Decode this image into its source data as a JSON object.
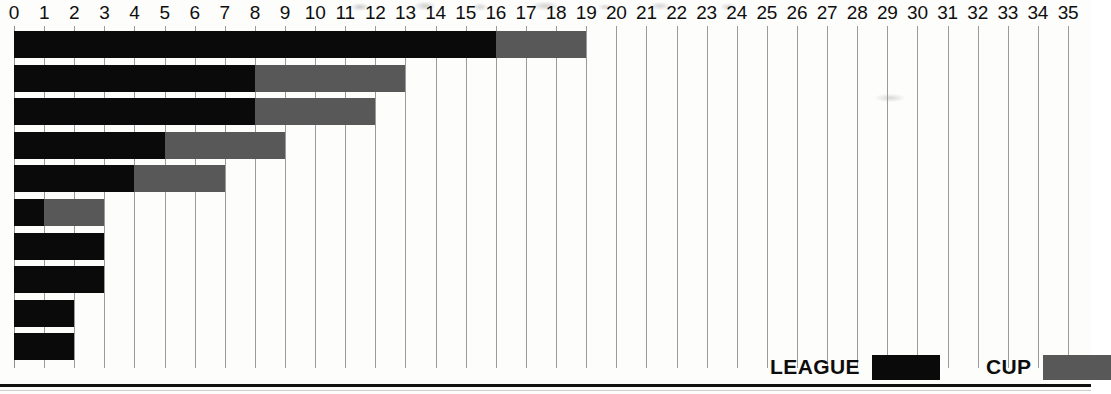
{
  "chart_data": {
    "type": "bar",
    "orientation": "horizontal",
    "stacked": true,
    "title": "",
    "subtitle": "",
    "xlabel": "",
    "ylabel": "",
    "xlim": [
      0,
      35
    ],
    "x_ticks": [
      0,
      1,
      2,
      3,
      4,
      5,
      6,
      7,
      8,
      9,
      10,
      11,
      12,
      13,
      14,
      15,
      16,
      17,
      18,
      19,
      20,
      21,
      22,
      23,
      24,
      25,
      26,
      27,
      28,
      29,
      30,
      31,
      32,
      33,
      34,
      35
    ],
    "x_tick_labels": [
      "0",
      "1",
      "2",
      "3",
      "4",
      "5",
      "6",
      "7",
      "8",
      "9",
      "10",
      "11",
      "12",
      "13",
      "14",
      "15",
      "16",
      "17",
      "18",
      "19",
      "20",
      "21",
      "22",
      "23",
      "24",
      "25",
      "26",
      "27",
      "28",
      "29",
      "30",
      "31",
      "32",
      "33",
      "34",
      "35"
    ],
    "grid": true,
    "grid_axis": "x",
    "categories": [
      "",
      "",
      "",
      "",
      "",
      "",
      "",
      "",
      "",
      ""
    ],
    "series": [
      {
        "name": "LEAGUE",
        "color": "#0a0a0a",
        "values": [
          16,
          8,
          8,
          5,
          4,
          1,
          3,
          3,
          2,
          2
        ]
      },
      {
        "name": "CUP",
        "color": "#585858",
        "values": [
          3,
          5,
          4,
          4,
          3,
          2,
          0,
          0,
          0,
          0
        ]
      }
    ],
    "totals": [
      19,
      13,
      12,
      9,
      7,
      3,
      3,
      3,
      2,
      2
    ],
    "legend": {
      "position": "bottom-right",
      "entries": [
        {
          "label": "LEAGUE",
          "color": "#0a0a0a"
        },
        {
          "label": "CUP",
          "color": "#585858"
        }
      ]
    },
    "colors": {
      "league": "#0a0a0a",
      "cup": "#585858",
      "gridline": "#9a9a9a",
      "axis_text": "#0e0e0e",
      "background": "#fdfdfc",
      "bottom_rule": "#111111"
    }
  }
}
